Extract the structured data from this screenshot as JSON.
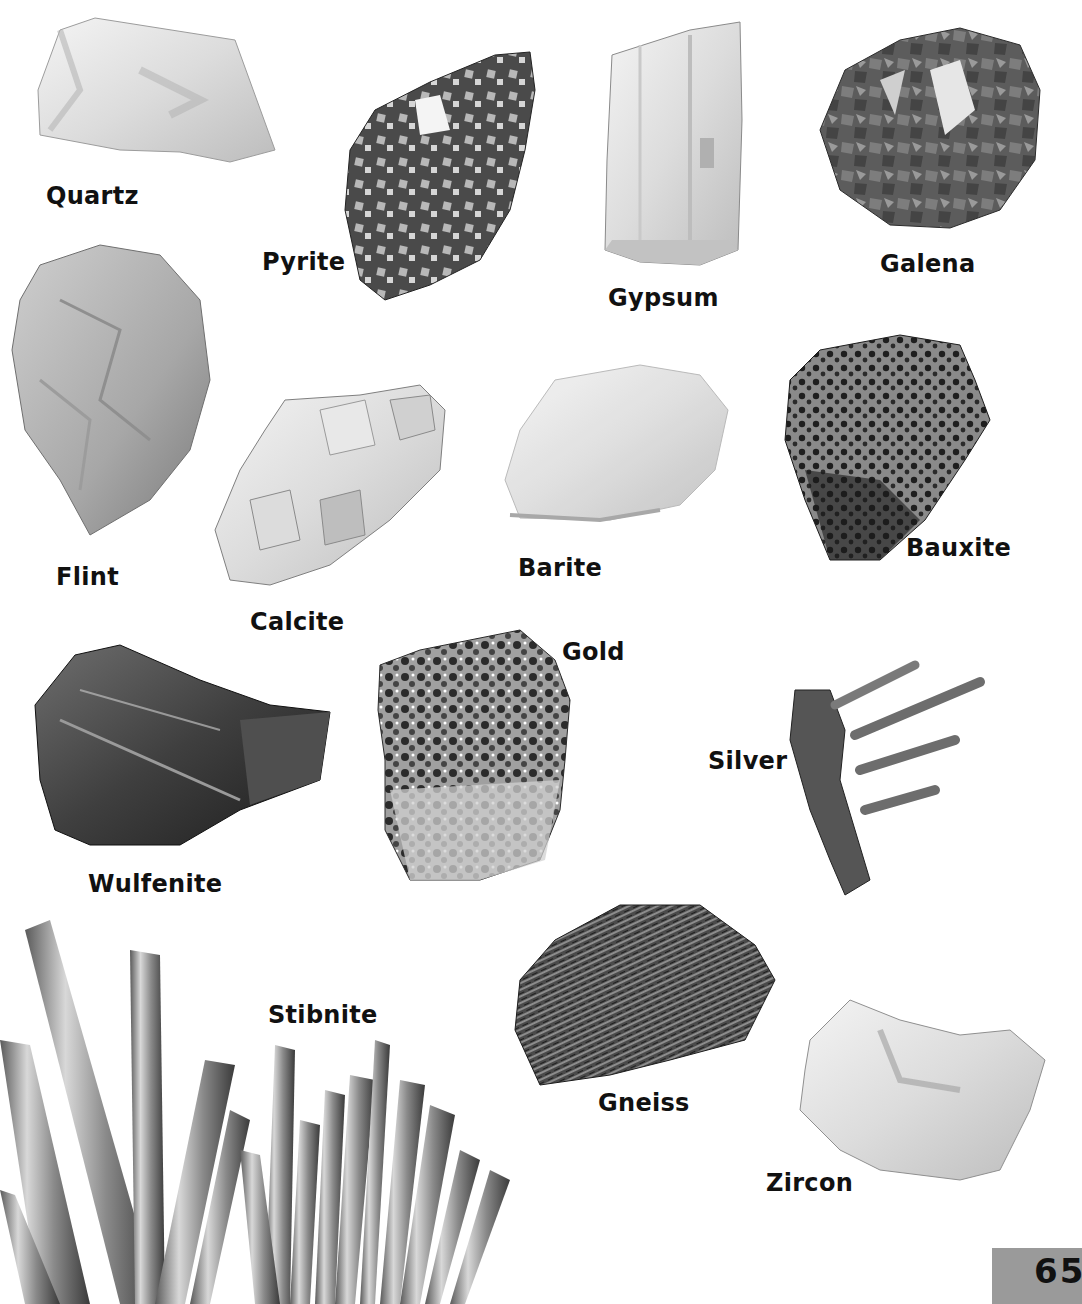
{
  "page": {
    "number": "65",
    "page_number_box_color": "#9a9a9a",
    "background_color": "#ffffff",
    "label_color": "#111111"
  },
  "specimens": [
    {
      "name": "Quartz",
      "label_x": 46,
      "label_y": 184
    },
    {
      "name": "Pyrite",
      "label_x": 262,
      "label_y": 250
    },
    {
      "name": "Gypsum",
      "label_x": 608,
      "label_y": 286
    },
    {
      "name": "Galena",
      "label_x": 880,
      "label_y": 252
    },
    {
      "name": "Flint",
      "label_x": 56,
      "label_y": 565
    },
    {
      "name": "Calcite",
      "label_x": 250,
      "label_y": 610
    },
    {
      "name": "Barite",
      "label_x": 518,
      "label_y": 556
    },
    {
      "name": "Bauxite",
      "label_x": 906,
      "label_y": 536
    },
    {
      "name": "Gold",
      "label_x": 562,
      "label_y": 640
    },
    {
      "name": "Silver",
      "label_x": 708,
      "label_y": 749
    },
    {
      "name": "Wulfenite",
      "label_x": 88,
      "label_y": 872
    },
    {
      "name": "Stibnite",
      "label_x": 268,
      "label_y": 1003
    },
    {
      "name": "Gneiss",
      "label_x": 598,
      "label_y": 1091
    },
    {
      "name": "Zircon",
      "label_x": 766,
      "label_y": 1171
    }
  ]
}
